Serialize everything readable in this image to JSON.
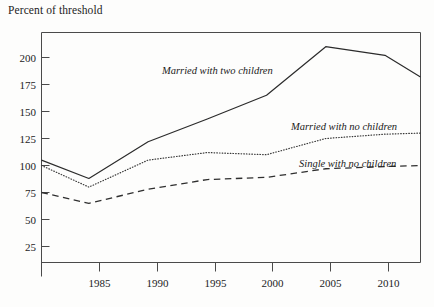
{
  "chart_data": {
    "type": "line",
    "title": "",
    "ylabel": "Percent of threshold",
    "xlabel": "",
    "ylim": [
      0,
      215
    ],
    "xlim": [
      1981,
      2013
    ],
    "grid": false,
    "legend_position": "inline-annotations",
    "yticks": [
      25,
      50,
      75,
      100,
      125,
      150,
      175,
      200
    ],
    "ytick_labels": [
      "25",
      "50",
      "75",
      "100",
      "125",
      "150",
      "175",
      "200"
    ],
    "xticks": [
      1985,
      1990,
      1995,
      2000,
      2005,
      2010
    ],
    "xtick_labels": [
      "1985",
      "1990",
      "1995",
      "2000",
      "2005",
      "2010"
    ],
    "x": [
      1981,
      1985,
      1990,
      1995,
      2000,
      2005,
      2010,
      2013
    ],
    "series": [
      {
        "name": "Married with two children",
        "style": "solid",
        "label_text": "Married with two children",
        "values": [
          105,
          88,
          122,
          143,
          165,
          210,
          202,
          182
        ]
      },
      {
        "name": "Married with no children",
        "style": "dotted",
        "label_text": "Married with no children",
        "values": [
          100,
          80,
          105,
          112,
          110,
          125,
          129,
          130
        ]
      },
      {
        "name": "Single with no children",
        "style": "dashed",
        "label_text": "Single with no children",
        "values": [
          75,
          65,
          78,
          87,
          89,
          97,
          99,
          100
        ]
      }
    ],
    "colors": {
      "background": "#fdfdfc",
      "axis": "#4a4a4a",
      "series_solid": "#2b2b2b",
      "series_dotted": "#3a3a3a",
      "series_dashed": "#2f2f2f",
      "text": "#1a1a1a"
    }
  }
}
